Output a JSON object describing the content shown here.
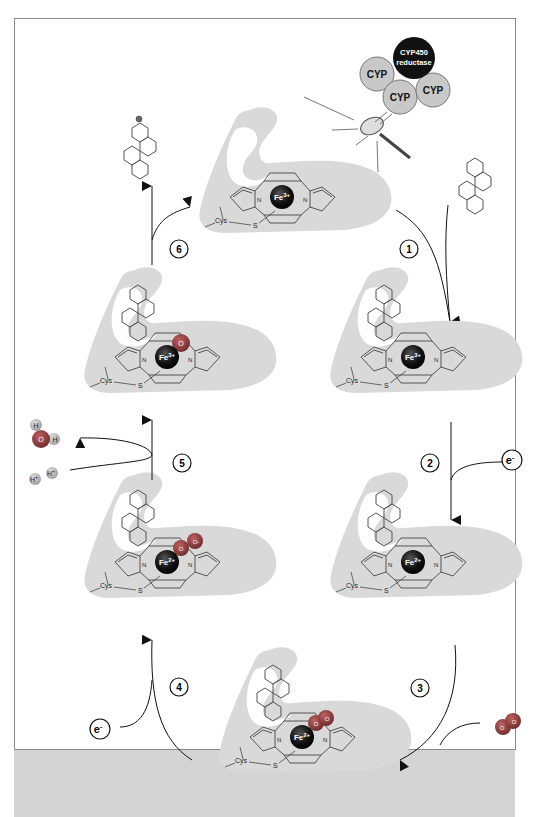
{
  "diagram": {
    "colors": {
      "protein": "#d9d9d9",
      "iron": "#111111",
      "oxygen": "#8a3a3a",
      "hydrogen": "#b0b0b0",
      "cyp": "#c8c8c8",
      "reductase": "#111111",
      "arrow": "#111111",
      "frame": "#8a8a8a",
      "footer": "#d4d4d4"
    },
    "enzyme_cluster": {
      "reductase_label_1": "CYP450",
      "reductase_label_2": "reductase",
      "cyp_labels": [
        "CYP",
        "CYP",
        "CYP"
      ]
    },
    "steps": [
      "1",
      "2",
      "3",
      "4",
      "5",
      "6"
    ],
    "states": [
      {
        "id": "resting",
        "iron": "Fe3+",
        "iron_base": "Fe",
        "iron_sup": "3+",
        "ligands": []
      },
      {
        "id": "substrate-bound",
        "iron": "Fe3+",
        "iron_base": "Fe",
        "iron_sup": "3+",
        "ligands": []
      },
      {
        "id": "reduced",
        "iron": "Fe2+",
        "iron_base": "Fe",
        "iron_sup": "2+",
        "ligands": []
      },
      {
        "id": "oxy",
        "iron": "Fe2+",
        "iron_base": "Fe",
        "iron_sup": "2+",
        "ligands": [
          "O",
          "O"
        ]
      },
      {
        "id": "peroxo",
        "iron": "Fe2+",
        "iron_base": "Fe",
        "iron_sup": "2+",
        "ligands": [
          "O",
          "O-"
        ]
      },
      {
        "id": "oxo",
        "iron": "Fe3+",
        "iron_base": "Fe",
        "iron_sup": "3+",
        "ligands": [
          "O"
        ]
      }
    ],
    "heme_labels": {
      "n": "N",
      "cys": "Cys",
      "s": "S"
    },
    "reagents": {
      "electron": "e-",
      "electron_base": "e",
      "electron_sup": "-",
      "dioxygen": [
        "O",
        "O"
      ],
      "water": {
        "o": "O",
        "h1": "H",
        "h2": "H"
      },
      "protons": [
        "H+",
        "H+"
      ],
      "proton_base": "H",
      "proton_sup": "+"
    }
  }
}
